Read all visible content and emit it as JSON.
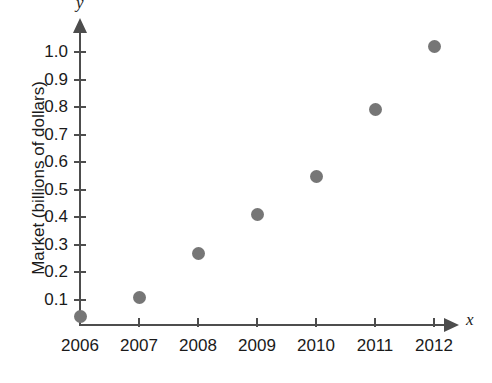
{
  "chart_data": {
    "type": "scatter",
    "title": "",
    "xlabel": "x",
    "ylabel": "Market (billions of dollars)",
    "categories": [
      "2006",
      "2007",
      "2008",
      "2009",
      "2010",
      "2011",
      "2012"
    ],
    "x": [
      2006,
      2007,
      2008,
      2009,
      2010,
      2011,
      2012
    ],
    "values": [
      0.04,
      0.11,
      0.27,
      0.41,
      0.55,
      0.79,
      1.02
    ],
    "series": [
      {
        "name": "Market",
        "values": [
          0.04,
          0.11,
          0.27,
          0.41,
          0.55,
          0.79,
          1.02
        ]
      }
    ],
    "xtick_labels": [
      "2006",
      "2007",
      "2008",
      "2009",
      "2010",
      "2011",
      "2012"
    ],
    "ytick_labels": [
      "0.1",
      "0.2",
      "0.3",
      "0.4",
      "0.5",
      "0.6",
      "0.7",
      "0.8",
      "0.9",
      "1.0"
    ],
    "ytick_values": [
      0.1,
      0.2,
      0.3,
      0.4,
      0.5,
      0.6,
      0.7,
      0.8,
      0.9,
      1.0
    ],
    "xlim": [
      2005.65,
      2012.6
    ],
    "ylim": [
      0,
      1.1
    ],
    "grid": false,
    "legend": false,
    "marker_color": "#767676",
    "axis_color": "#4d4d4d",
    "text_color": "#1a1a1a",
    "axis_variable_x": "x",
    "axis_variable_y": "y"
  }
}
